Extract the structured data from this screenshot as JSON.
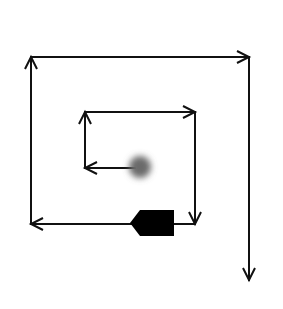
{
  "diagram": {
    "type": "spiral-arrow-path",
    "background": "#ffffff",
    "stroke_color": "#111111",
    "stroke_width": 2,
    "start_marker": {
      "shape": "blurred-dot",
      "cx": 140,
      "cy": 167,
      "r": 11,
      "color": "#6a6a6a"
    },
    "obstacle": {
      "shape": "pentagon-arrow-block",
      "color": "#000000",
      "points": "130,223 140,210 174,210 174,236 140,236"
    },
    "segments": [
      {
        "id": "seg-1",
        "from": [
          135,
          168
        ],
        "to": [
          85,
          168
        ],
        "direction": "left"
      },
      {
        "id": "seg-2",
        "from": [
          85,
          168
        ],
        "to": [
          85,
          112
        ],
        "direction": "up"
      },
      {
        "id": "seg-3",
        "from": [
          85,
          112
        ],
        "to": [
          195,
          112
        ],
        "direction": "right"
      },
      {
        "id": "seg-4",
        "from": [
          195,
          112
        ],
        "to": [
          195,
          224
        ],
        "direction": "down"
      },
      {
        "id": "seg-5",
        "from": [
          195,
          224
        ],
        "to": [
          31,
          224
        ],
        "direction": "left"
      },
      {
        "id": "seg-6",
        "from": [
          31,
          224
        ],
        "to": [
          31,
          57
        ],
        "direction": "up"
      },
      {
        "id": "seg-7",
        "from": [
          31,
          57
        ],
        "to": [
          249,
          57
        ],
        "direction": "right"
      },
      {
        "id": "seg-8",
        "from": [
          249,
          57
        ],
        "to": [
          249,
          280
        ],
        "direction": "down"
      }
    ]
  }
}
